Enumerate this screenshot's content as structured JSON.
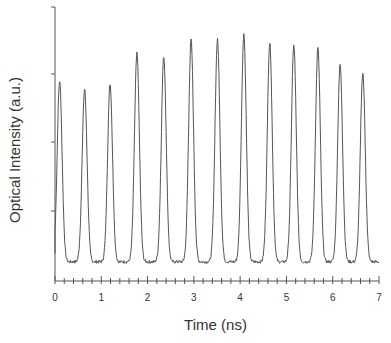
{
  "chart_data": {
    "type": "line",
    "title": "",
    "xlabel": "Time  (ns)",
    "ylabel": "Optical  Intensity  (a.u.)",
    "xlim": [
      0,
      7
    ],
    "x_ticks": [
      0,
      1,
      2,
      3,
      4,
      5,
      6,
      7
    ],
    "y_ticks_labeled": false,
    "ylim": [
      0,
      1
    ],
    "grid": false,
    "legend": null,
    "series": [
      {
        "name": "pulse train",
        "peaks": [
          {
            "t": 0.1,
            "intensity": 0.73
          },
          {
            "t": 0.64,
            "intensity": 0.7
          },
          {
            "t": 1.19,
            "intensity": 0.72
          },
          {
            "t": 1.77,
            "intensity": 0.83
          },
          {
            "t": 2.35,
            "intensity": 0.82
          },
          {
            "t": 2.94,
            "intensity": 0.88
          },
          {
            "t": 3.51,
            "intensity": 0.88
          },
          {
            "t": 4.08,
            "intensity": 0.9
          },
          {
            "t": 4.64,
            "intensity": 0.87
          },
          {
            "t": 5.16,
            "intensity": 0.86
          },
          {
            "t": 5.68,
            "intensity": 0.85
          },
          {
            "t": 6.16,
            "intensity": 0.79
          },
          {
            "t": 6.65,
            "intensity": 0.76
          }
        ],
        "baseline": 0.07
      }
    ]
  },
  "axes": {
    "xlabel": "Time  (ns)",
    "ylabel": "Optical  Intensity  (a.u.)",
    "x_tick_labels": [
      "0",
      "1",
      "2",
      "3",
      "4",
      "5",
      "6",
      "7"
    ]
  }
}
